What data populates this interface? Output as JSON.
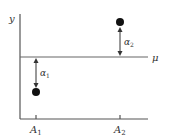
{
  "diagram": {
    "y_axis_label": "y",
    "mean_line_label": "μ",
    "categories": [
      {
        "label": "A",
        "sub": "1",
        "effect_label": "α",
        "effect_sub": "1",
        "direction": "below"
      },
      {
        "label": "A",
        "sub": "2",
        "effect_label": "α",
        "effect_sub": "2",
        "direction": "above"
      }
    ],
    "colors": {
      "axis": "#555555",
      "point": "#111111",
      "text": "#333333"
    }
  }
}
